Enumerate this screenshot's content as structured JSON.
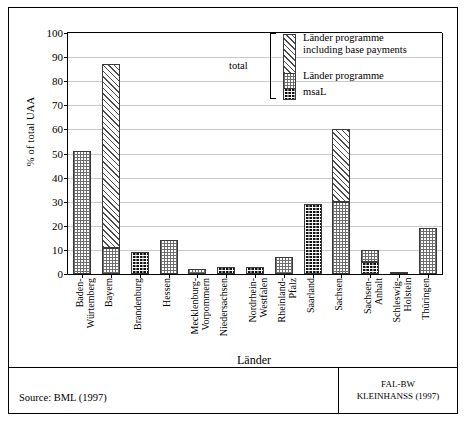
{
  "chart_data": {
    "type": "bar",
    "title": "",
    "xlabel": "Länder",
    "ylabel": "% of total UAA",
    "ylim": [
      0,
      100
    ],
    "ytick_step": 10,
    "yticks": [
      0,
      10,
      20,
      30,
      40,
      50,
      60,
      70,
      80,
      90,
      100
    ],
    "grid": true,
    "legend_position": "top-right",
    "stacked": true,
    "categories": [
      "Baden-\nWürtemberg",
      "Bayern",
      "Brandenburg",
      "Hessen",
      "Mecklenburg-\nVorpommern",
      "Niedersachsen",
      "Nordrhein-\nWestfalen",
      "Rheinland-\nPfalz",
      "Saarland",
      "Sachsen",
      "Sachsen-\nAnhalt",
      "Schleswig-\nHolstein",
      "Thüringen"
    ],
    "series": [
      {
        "name": "msaL",
        "pattern": "black",
        "values": [
          0,
          0,
          9,
          0,
          0,
          3,
          3,
          0,
          29,
          0,
          5,
          1,
          0
        ]
      },
      {
        "name": "Länder programme",
        "pattern": "checkerboard",
        "values": [
          51,
          11,
          9,
          14,
          2,
          3,
          3,
          7,
          29,
          30,
          10,
          1,
          19
        ]
      },
      {
        "name": "Länder programme including base payments",
        "pattern": "diagonal",
        "values": [
          51,
          87,
          9,
          14,
          2,
          3,
          3,
          7,
          29,
          60,
          10,
          1,
          19
        ]
      }
    ]
  },
  "legend": {
    "total_label": "total",
    "entries": [
      {
        "label": "Länder programme\nincluding base payments",
        "pattern": "diagonal"
      },
      {
        "label": "Länder programme",
        "pattern": "checkerboard"
      },
      {
        "label": "msaL",
        "pattern": "black"
      }
    ]
  },
  "footer": {
    "source": "Source: BML (1997)",
    "credit": "FAL-BW\nKLEINHANSS (1997)"
  }
}
